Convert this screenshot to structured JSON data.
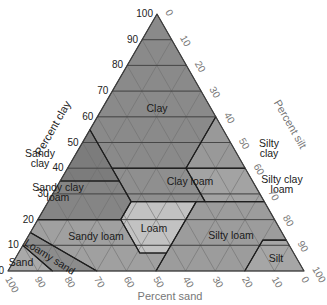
{
  "diagram": {
    "triangle": {
      "apex": [
        157,
        14
      ],
      "bottom_left": [
        8,
        271
      ],
      "bottom_right": [
        304,
        271
      ]
    },
    "axes": {
      "clay": {
        "title": "Percent clay",
        "ticks": [
          "0",
          "10",
          "20",
          "30",
          "40",
          "50",
          "60",
          "70",
          "80",
          "90",
          "100"
        ],
        "color": "#222222"
      },
      "silt": {
        "title": "Percent silt",
        "ticks": [
          "0",
          "10",
          "20",
          "30",
          "40",
          "50",
          "60",
          "70",
          "80",
          "90",
          "100"
        ],
        "color": "#777777"
      },
      "sand": {
        "title": "Percent sand",
        "ticks": [
          "100",
          "90",
          "80",
          "70",
          "60",
          "50",
          "40",
          "30",
          "20",
          "10",
          "0"
        ],
        "color": "#777777"
      }
    },
    "colors": {
      "triangle_fill": "#8e8e8e",
      "grid_line": "#6e6e6e",
      "boundary": "#1e1e1e",
      "clay": "#8a8a8a",
      "sandy_clay": "#7c7c7c",
      "silty_clay": "#999999",
      "clay_loam": "#8f8f8f",
      "sandy_clay_loam": "#858585",
      "silty_clay_loam": "#a3a3a3",
      "loam": "#c2c2c2",
      "sandy_loam": "#a0a0a0",
      "silty_loam": "#9c9c9c",
      "loamy_sand": "#8c8c8c",
      "sand": "#a9a9a9",
      "silt": "#a6a6a6"
    },
    "regions": [
      {
        "name": "Clay",
        "key": "clay",
        "label_pos": [
          157,
          112
        ],
        "lines": [
          "Clay"
        ],
        "vertices": [
          [
            100,
            0,
            0
          ],
          [
            55,
            45,
            0
          ],
          [
            40,
            45,
            15
          ],
          [
            40,
            20,
            40
          ],
          [
            60,
            0,
            40
          ]
        ]
      },
      {
        "name": "Sandy clay",
        "key": "sandy_clay",
        "label_pos": [
          40,
          162
        ],
        "lines": [
          "Sandy",
          "clay"
        ],
        "vertices": [
          [
            55,
            45,
            0
          ],
          [
            35,
            65,
            0
          ],
          [
            35,
            45,
            20
          ],
          [
            40,
            45,
            15
          ]
        ]
      },
      {
        "name": "Silty clay",
        "key": "silty_clay",
        "label_pos": [
          269,
          152
        ],
        "lines": [
          "Silty",
          "clay"
        ],
        "vertices": [
          [
            60,
            0,
            40
          ],
          [
            40,
            20,
            40
          ],
          [
            40,
            0,
            60
          ]
        ]
      },
      {
        "name": "Clay loam",
        "key": "clay_loam",
        "label_pos": [
          190,
          185
        ],
        "lines": [
          "Clay loam"
        ],
        "vertices": [
          [
            40,
            45,
            15
          ],
          [
            27,
            45,
            28
          ],
          [
            27,
            20,
            53
          ],
          [
            40,
            20,
            40
          ]
        ]
      },
      {
        "name": "Sandy clay loam",
        "key": "sandy_clay_loam",
        "label_pos": [
          58,
          196
        ],
        "lines": [
          "Sandy clay",
          "loam"
        ],
        "vertices": [
          [
            35,
            65,
            0
          ],
          [
            20,
            80,
            0
          ],
          [
            20,
            52,
            28
          ],
          [
            27,
            45,
            28
          ],
          [
            35,
            45,
            20
          ]
        ]
      },
      {
        "name": "Silty clay loam",
        "key": "silty_clay_loam",
        "label_pos": [
          282,
          188
        ],
        "lines": [
          "Silty clay",
          "loam"
        ],
        "vertices": [
          [
            40,
            20,
            40
          ],
          [
            27,
            20,
            53
          ],
          [
            27,
            0,
            73
          ],
          [
            40,
            0,
            60
          ]
        ]
      },
      {
        "name": "Loam",
        "key": "loam",
        "label_pos": [
          154,
          232
        ],
        "lines": [
          "Loam"
        ],
        "vertices": [
          [
            27,
            45,
            28
          ],
          [
            20,
            52,
            28
          ],
          [
            7,
            52,
            41
          ],
          [
            7,
            43,
            50
          ],
          [
            27,
            23,
            50
          ]
        ]
      },
      {
        "name": "Sandy loam",
        "key": "sandy_loam",
        "label_pos": [
          96,
          240
        ],
        "lines": [
          "Sandy loam"
        ],
        "vertices": [
          [
            20,
            80,
            0
          ],
          [
            15,
            85,
            0
          ],
          [
            0,
            70,
            30
          ],
          [
            0,
            50,
            50
          ],
          [
            7,
            43,
            50
          ],
          [
            7,
            52,
            41
          ],
          [
            20,
            52,
            28
          ]
        ]
      },
      {
        "name": "Silty loam",
        "key": "silty_loam",
        "label_pos": [
          231,
          239
        ],
        "lines": [
          "Silty loam"
        ],
        "vertices": [
          [
            27,
            23,
            50
          ],
          [
            7,
            43,
            50
          ],
          [
            0,
            50,
            50
          ],
          [
            0,
            20,
            80
          ],
          [
            12,
            8,
            80
          ],
          [
            12,
            0,
            88
          ],
          [
            27,
            0,
            73
          ],
          [
            27,
            20,
            53
          ]
        ]
      },
      {
        "name": "Loamy sand",
        "key": "loamy_sand",
        "label_pos": [
          48,
          260
        ],
        "lines": [
          "Loamy sand"
        ],
        "rotate": 32,
        "vertices": [
          [
            15,
            85,
            0
          ],
          [
            10,
            90,
            0
          ],
          [
            0,
            85,
            15
          ],
          [
            0,
            70,
            30
          ]
        ]
      },
      {
        "name": "Sand",
        "key": "sand",
        "label_pos": [
          21,
          266
        ],
        "lines": [
          "Sand"
        ],
        "vertices": [
          [
            10,
            90,
            0
          ],
          [
            0,
            100,
            0
          ],
          [
            0,
            85,
            15
          ]
        ]
      },
      {
        "name": "Silt",
        "key": "silt",
        "label_pos": [
          276,
          262
        ],
        "lines": [
          "Silt"
        ],
        "vertices": [
          [
            12,
            8,
            80
          ],
          [
            0,
            20,
            80
          ],
          [
            0,
            0,
            100
          ],
          [
            12,
            0,
            88
          ]
        ]
      }
    ]
  }
}
